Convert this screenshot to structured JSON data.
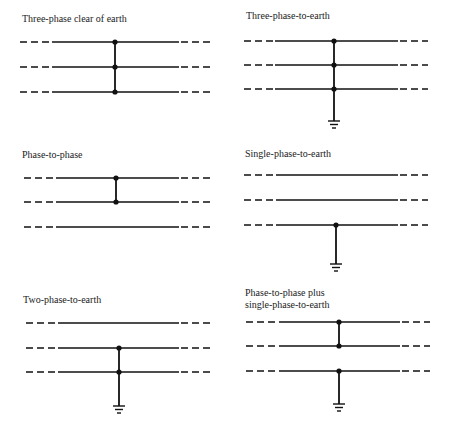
{
  "colors": {
    "line": "#111111",
    "text": "#222222",
    "background": "#ffffff"
  },
  "panels": [
    {
      "id": "three-phase-clear-of-earth",
      "label_lines": [
        "Three-phase clear of earth"
      ],
      "label_x": 22,
      "label_y": [
        22
      ],
      "x_dash_l": 20,
      "x_solid_l": 52,
      "x_solid_r": 179,
      "x_dash_r": 211,
      "phases_y": [
        42,
        67,
        92
      ],
      "fault_x": 115,
      "connected_phases": [
        0,
        1,
        2
      ],
      "earth": false
    },
    {
      "id": "three-phase-to-earth",
      "label_lines": [
        "Three-phase-to-earth"
      ],
      "label_x": 246,
      "label_y": [
        19
      ],
      "x_dash_l": 244,
      "x_solid_l": 275,
      "x_solid_r": 398,
      "x_dash_r": 428,
      "phases_y": [
        41,
        65,
        89
      ],
      "fault_x": 334,
      "connected_phases": [
        0,
        1,
        2
      ],
      "earth": true,
      "earth_y": 121
    },
    {
      "id": "phase-to-phase",
      "label_lines": [
        "Phase-to-phase"
      ],
      "label_x": 22,
      "label_y": [
        158
      ],
      "x_dash_l": 24,
      "x_solid_l": 56,
      "x_solid_r": 179,
      "x_dash_r": 211,
      "phases_y": [
        178,
        202,
        227
      ],
      "fault_x": 116,
      "connected_phases": [
        0,
        1
      ],
      "earth": false
    },
    {
      "id": "single-phase-to-earth",
      "label_lines": [
        "Single-phase-to-earth"
      ],
      "label_x": 245,
      "label_y": [
        157
      ],
      "x_dash_l": 244,
      "x_solid_l": 276,
      "x_solid_r": 398,
      "x_dash_r": 428,
      "phases_y": [
        175,
        200,
        225
      ],
      "fault_x": 336,
      "connected_phases": [
        2
      ],
      "earth": true,
      "earth_y": 264
    },
    {
      "id": "two-phase-to-earth",
      "label_lines": [
        "Two-phase-to-earth"
      ],
      "label_x": 23,
      "label_y": [
        303
      ],
      "x_dash_l": 26,
      "x_solid_l": 58,
      "x_solid_r": 179,
      "x_dash_r": 212,
      "phases_y": [
        323,
        348,
        372
      ],
      "fault_x": 119,
      "connected_phases": [
        1,
        2
      ],
      "earth": true,
      "earth_y": 406
    },
    {
      "id": "phase-to-phase-plus-single-phase-to-earth",
      "label_lines": [
        "Phase-to-phase plus",
        "single-phase-to-earth"
      ],
      "label_x": 245,
      "label_y": [
        296,
        308
      ],
      "x_dash_l": 246,
      "x_solid_l": 279,
      "x_solid_r": 400,
      "x_dash_r": 430,
      "phases_y": [
        322,
        346,
        371
      ],
      "fault_x": 339,
      "connected_phases": [
        0,
        1
      ],
      "earth_phase": 2,
      "earth": true,
      "earth_y": 404
    }
  ]
}
